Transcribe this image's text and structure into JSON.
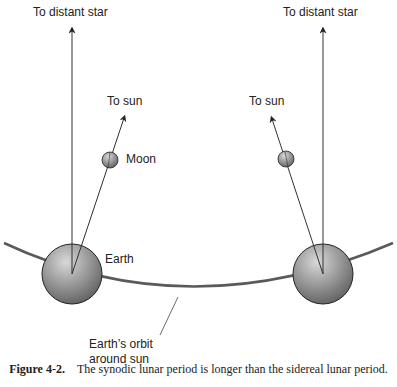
{
  "labels": {
    "star_left": "To distant star",
    "star_right": "To distant star",
    "sun_left": "To sun",
    "sun_right": "To sun",
    "moon": "Moon",
    "earth": "Earth",
    "orbit_line1": "Earth’s orbit",
    "orbit_line2": "around sun"
  },
  "caption": {
    "figure": "Figure 4-2.",
    "text": "The synodic lunar period is longer than the sidereal lunar period."
  },
  "colors": {
    "line": "#333333",
    "orbit": "#555555",
    "sphere_light": "#d0d0d0",
    "sphere_dark": "#6a6a6a"
  }
}
